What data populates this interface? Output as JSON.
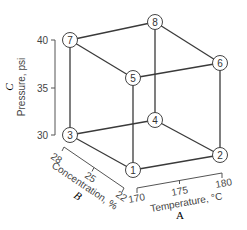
{
  "diagram": {
    "type": "cube-design-space",
    "nodes": [
      {
        "id": "1",
        "label": "1",
        "A": 170,
        "B": 22,
        "C": 30
      },
      {
        "id": "2",
        "label": "2",
        "A": 180,
        "B": 22,
        "C": 30
      },
      {
        "id": "3",
        "label": "3",
        "A": 170,
        "B": 28,
        "C": 30
      },
      {
        "id": "4",
        "label": "4",
        "A": 180,
        "B": 28,
        "C": 30
      },
      {
        "id": "5",
        "label": "5",
        "A": 170,
        "B": 22,
        "C": 40
      },
      {
        "id": "6",
        "label": "6",
        "A": 180,
        "B": 22,
        "C": 40
      },
      {
        "id": "7",
        "label": "7",
        "A": 170,
        "B": 28,
        "C": 40
      },
      {
        "id": "8",
        "label": "8",
        "A": 180,
        "B": 28,
        "C": 40
      }
    ],
    "axes": {
      "pressure": {
        "name": "Pressure, psi",
        "factor": "C",
        "ticks": [
          "40",
          "35",
          "30"
        ]
      },
      "concentration": {
        "name": "Concentration, %",
        "factor": "B",
        "ticks": [
          "28",
          "25",
          "22"
        ]
      },
      "temperature": {
        "name": "Temperature, °C",
        "factor": "A",
        "ticks": [
          "170",
          "175",
          "180"
        ]
      }
    }
  }
}
